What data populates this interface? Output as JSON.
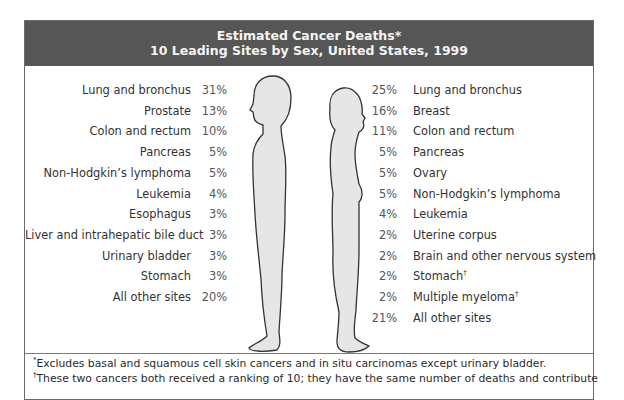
{
  "title": {
    "line1": "Estimated Cancer Deaths*",
    "line2": "10 Leading Sites by Sex, United States, 1999"
  },
  "male": {
    "figure": "male-silhouette-icon",
    "rows": [
      {
        "site": "Lung and bronchus",
        "pct": "31%"
      },
      {
        "site": "Prostate",
        "pct": "13%"
      },
      {
        "site": "Colon and rectum",
        "pct": "10%"
      },
      {
        "site": "Pancreas",
        "pct": "5%"
      },
      {
        "site": "Non-Hodgkin’s lymphoma",
        "pct": "5%"
      },
      {
        "site": "Leukemia",
        "pct": "4%"
      },
      {
        "site": "Esophagus",
        "pct": "3%"
      },
      {
        "site": "Liver and intrahepatic bile duct",
        "pct": "3%"
      },
      {
        "site": "Urinary bladder",
        "pct": "3%"
      },
      {
        "site": "Stomach",
        "pct": "3%"
      },
      {
        "site": "All other sites",
        "pct": "20%"
      }
    ]
  },
  "female": {
    "figure": "female-silhouette-icon",
    "rows": [
      {
        "site": "Lung and bronchus",
        "pct": "25%",
        "mark": ""
      },
      {
        "site": "Breast",
        "pct": "16%",
        "mark": ""
      },
      {
        "site": "Colon and rectum",
        "pct": "11%",
        "mark": ""
      },
      {
        "site": "Pancreas",
        "pct": "5%",
        "mark": ""
      },
      {
        "site": "Ovary",
        "pct": "5%",
        "mark": ""
      },
      {
        "site": "Non-Hodgkin’s lymphoma",
        "pct": "5%",
        "mark": ""
      },
      {
        "site": "Leukemia",
        "pct": "4%",
        "mark": ""
      },
      {
        "site": "Uterine corpus",
        "pct": "2%",
        "mark": ""
      },
      {
        "site": "Brain and other nervous system",
        "pct": "2%",
        "mark": ""
      },
      {
        "site": "Stomach",
        "pct": "2%",
        "mark": "†"
      },
      {
        "site": "Multiple myeloma",
        "pct": "2%",
        "mark": "†"
      },
      {
        "site": "All other sites",
        "pct": "21%",
        "mark": ""
      }
    ]
  },
  "footnotes": {
    "star_mark": "*",
    "star": "Excludes basal and squamous cell skin cancers and in situ carcinomas except urinary bladder.",
    "dagger_mark": "†",
    "dagger": "These two cancers both received a ranking of 10; they have the same number of deaths and contribute"
  },
  "colors": {
    "header_bg": "#565656",
    "header_text": "#f4f4f4",
    "figure_fill": "#e6e6e6",
    "figure_stroke": "#333333",
    "border": "#6a6a6a"
  },
  "chart_data": {
    "type": "table",
    "series": [
      {
        "name": "Male",
        "categories": [
          "Lung and bronchus",
          "Prostate",
          "Colon and rectum",
          "Pancreas",
          "Non-Hodgkin’s lymphoma",
          "Leukemia",
          "Esophagus",
          "Liver and intrahepatic bile duct",
          "Urinary bladder",
          "Stomach",
          "All other sites"
        ],
        "values": [
          31,
          13,
          10,
          5,
          5,
          4,
          3,
          3,
          3,
          3,
          20
        ],
        "unit": "%"
      },
      {
        "name": "Female",
        "categories": [
          "Lung and bronchus",
          "Breast",
          "Colon and rectum",
          "Pancreas",
          "Ovary",
          "Non-Hodgkin’s lymphoma",
          "Leukemia",
          "Uterine corpus",
          "Brain and other nervous system",
          "Stomach†",
          "Multiple myeloma†",
          "All other sites"
        ],
        "values": [
          25,
          16,
          11,
          5,
          5,
          5,
          4,
          2,
          2,
          2,
          2,
          21
        ],
        "unit": "%"
      }
    ],
    "annotations": [
      "*Excludes basal and squamous cell skin cancers and in situ carcinomas except urinary bladder.",
      "†These two cancers both received a ranking of 10; they have the same number of deaths and contribute"
    ]
  }
}
